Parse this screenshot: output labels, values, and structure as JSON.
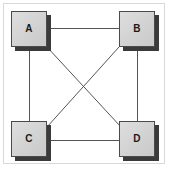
{
  "diagram": {
    "type": "graph",
    "background_color": "#ffffff",
    "frame": {
      "visible": true,
      "color": "#d8d8d8"
    },
    "node_style": {
      "fill_color": "#d4d4d4",
      "border_color": "#4a4a4a",
      "shadow_color": "#3a3a3a",
      "label_color": "#1a1a1a",
      "width": 36,
      "height": 36
    },
    "edge_style": {
      "color": "#555555",
      "width": 1
    },
    "nodes": [
      {
        "id": "A",
        "label": "A",
        "x": 11,
        "y": 11,
        "position": "top-left"
      },
      {
        "id": "B",
        "label": "B",
        "x": 119,
        "y": 11,
        "position": "top-right"
      },
      {
        "id": "C",
        "label": "C",
        "x": 11,
        "y": 121,
        "position": "bottom-left"
      },
      {
        "id": "D",
        "label": "D",
        "x": 119,
        "y": 121,
        "position": "bottom-right"
      }
    ],
    "edges": [
      {
        "from": "A",
        "to": "B",
        "kind": "horizontal-top",
        "x1": 47,
        "y1": 28,
        "x2": 119,
        "y2": 28
      },
      {
        "from": "C",
        "to": "D",
        "kind": "horizontal-bottom",
        "x1": 47,
        "y1": 140,
        "x2": 119,
        "y2": 140
      },
      {
        "from": "A",
        "to": "C",
        "kind": "vertical-left",
        "x1": 29,
        "y1": 47,
        "x2": 29,
        "y2": 121
      },
      {
        "from": "B",
        "to": "D",
        "kind": "vertical-right",
        "x1": 137,
        "y1": 47,
        "x2": 137,
        "y2": 121
      },
      {
        "from": "A",
        "to": "D",
        "kind": "diagonal-down",
        "x1": 47,
        "y1": 47,
        "x2": 121,
        "y2": 127
      },
      {
        "from": "B",
        "to": "C",
        "kind": "diagonal-up",
        "x1": 119,
        "y1": 47,
        "x2": 47,
        "y2": 127
      }
    ],
    "edge_count": 6,
    "node_count": 4
  }
}
